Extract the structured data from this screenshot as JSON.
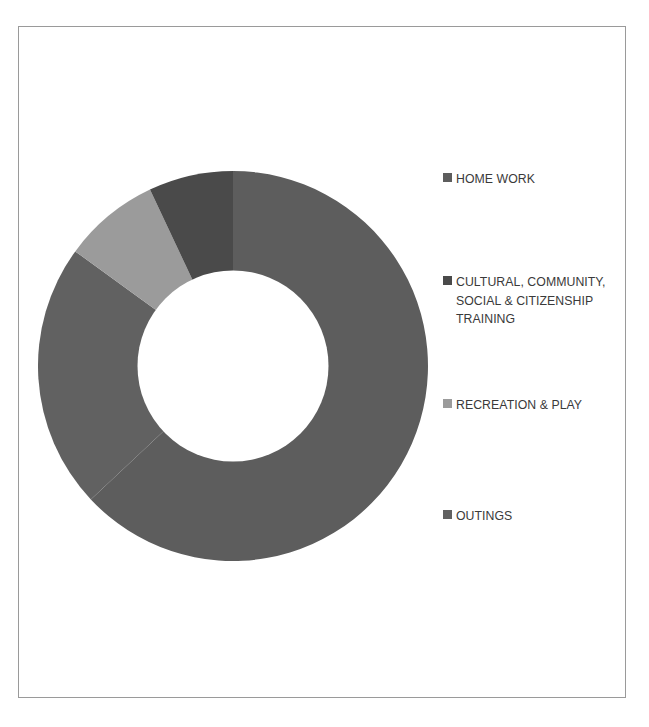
{
  "figure": {
    "clipped_header_text": "",
    "background_color": "#ffffff",
    "frame_color": "#9a9a9a"
  },
  "chart_data": {
    "type": "pie",
    "variant": "donut",
    "title": "",
    "subtitle": "",
    "xlabel": "",
    "ylabel": "",
    "grid": false,
    "legend_position": "right",
    "hole_ratio": 0.49,
    "start_angle_deg": 0,
    "direction": "clockwise",
    "categories": [
      "HOME WORK",
      "CULTURAL, COMMUNITY, SOCIAL & CITIZENSHIP TRAINING",
      "RECREATION & PLAY",
      "OUTINGS"
    ],
    "values": [
      63,
      7,
      8,
      22
    ],
    "units": "percent",
    "colors": [
      "#5d5d5d",
      "#4a4a4a",
      "#9b9b9b",
      "#616161"
    ],
    "slices": [
      {
        "label": "HOME WORK",
        "value": 63,
        "color": "#5d5d5d",
        "start_deg": 0,
        "end_deg": 226.8
      },
      {
        "label": "CULTURAL, COMMUNITY, SOCIAL & CITIZENSHIP TRAINING",
        "value": 22,
        "color": "#616161",
        "start_deg": 226.8,
        "end_deg": 306.0
      },
      {
        "label": "RECREATION & PLAY",
        "value": 8,
        "color": "#9b9b9b",
        "start_deg": 306.0,
        "end_deg": 334.8
      },
      {
        "label": "OUTINGS",
        "value": 7,
        "color": "#4a4a4a",
        "start_deg": 334.8,
        "end_deg": 360.0
      }
    ]
  },
  "legend": {
    "items": [
      {
        "label": "HOME WORK",
        "color": "#5d5d5d",
        "lines": [
          "HOME WORK"
        ]
      },
      {
        "label": "CULTURAL, COMMUNITY, SOCIAL & CITIZENSHIP TRAINING",
        "color": "#4a4a4a",
        "lines": [
          "CULTURAL, COMMUNITY,",
          "SOCIAL & CITIZENSHIP",
          "TRAINING"
        ]
      },
      {
        "label": "RECREATION & PLAY",
        "color": "#9b9b9b",
        "lines": [
          "RECREATION & PLAY"
        ]
      },
      {
        "label": "OUTINGS",
        "color": "#616161",
        "lines": [
          "OUTINGS"
        ]
      }
    ]
  }
}
